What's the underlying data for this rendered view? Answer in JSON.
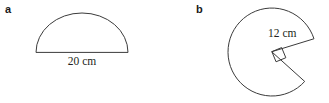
{
  "figures": [
    {
      "label": "a",
      "shape": "semicircle",
      "dimension_label": "20 cm",
      "dimension_value": 20,
      "dimension_unit": "cm",
      "dimension_of": "diameter"
    },
    {
      "label": "b",
      "shape": "circle-with-right-angle-sector-removed",
      "dimension_label": "12 cm",
      "dimension_value": 12,
      "dimension_unit": "cm",
      "dimension_of": "radius",
      "angle_marker": "right-angle"
    }
  ],
  "colors": {
    "background": "#ffffff",
    "stroke": "#3b3b3b",
    "text": "#231f20",
    "label": "#1a1a1a"
  }
}
